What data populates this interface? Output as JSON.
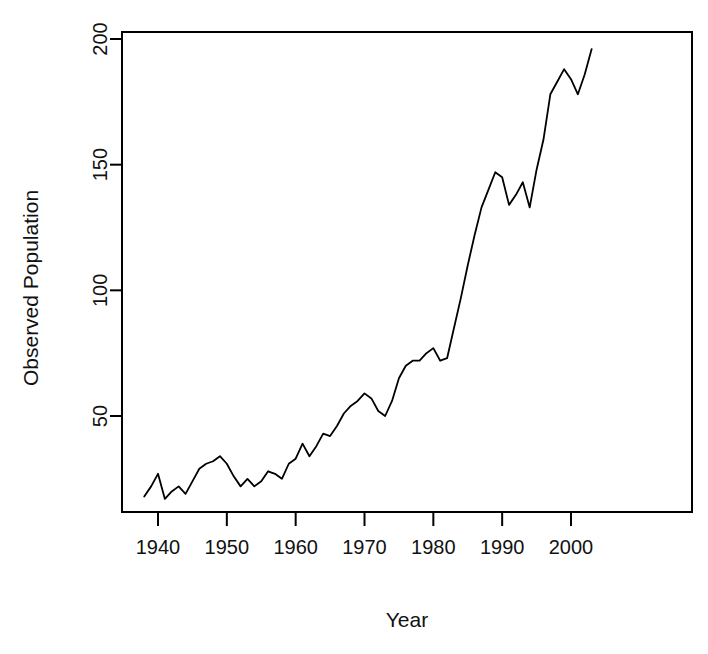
{
  "chart_data": {
    "type": "line",
    "title": "",
    "xlabel": "Year",
    "ylabel": "Observed Population",
    "xlim": [
      1937.5,
      2003.5
    ],
    "ylim": [
      12,
      202
    ],
    "grid": false,
    "legend": "none",
    "xticks": [
      1940,
      1950,
      1960,
      1970,
      1980,
      1990,
      2000
    ],
    "xtick_labels": [
      "1940",
      "1950",
      "1960",
      "1970",
      "1980",
      "1990",
      "2000"
    ],
    "yticks": [
      50,
      100,
      150,
      200
    ],
    "ytick_labels": [
      "50",
      "100",
      "150",
      "200"
    ],
    "line_color": "#000000",
    "line_width": 1.8,
    "series": [
      {
        "name": "Observed Population",
        "x": [
          1938,
          1939,
          1940,
          1941,
          1942,
          1943,
          1944,
          1945,
          1946,
          1947,
          1948,
          1949,
          1950,
          1951,
          1952,
          1953,
          1954,
          1955,
          1956,
          1957,
          1958,
          1959,
          1960,
          1961,
          1962,
          1963,
          1964,
          1965,
          1966,
          1967,
          1968,
          1969,
          1970,
          1971,
          1972,
          1973,
          1974,
          1975,
          1976,
          1977,
          1978,
          1979,
          1980,
          1981,
          1982,
          1983,
          1984,
          1985,
          1986,
          1987,
          1988,
          1989,
          1990,
          1991,
          1992,
          1993,
          1994,
          1995,
          1996,
          1997,
          1998,
          1999,
          2000,
          2001,
          2002,
          2003
        ],
        "values": [
          18,
          22,
          27,
          17,
          20,
          22,
          19,
          24,
          29,
          31,
          32,
          34,
          31,
          26,
          22,
          25,
          22,
          24,
          28,
          27,
          25,
          31,
          33,
          39,
          34,
          38,
          43,
          42,
          46,
          51,
          54,
          56,
          59,
          57,
          52,
          50,
          56,
          65,
          70,
          72,
          72,
          75,
          77,
          72,
          73,
          85,
          97,
          110,
          122,
          133,
          140,
          147,
          145,
          134,
          138,
          143,
          133,
          148,
          160,
          178,
          183,
          188,
          184,
          178,
          186,
          196
        ]
      }
    ]
  },
  "axes": {
    "x_title": "Year",
    "y_title": "Observed Population"
  }
}
